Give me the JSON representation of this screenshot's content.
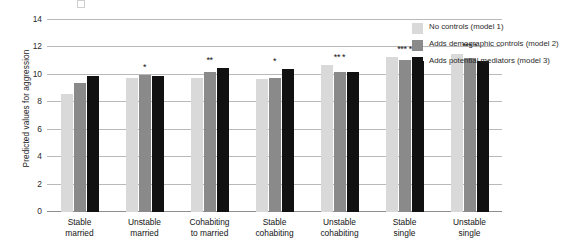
{
  "chart_data": {
    "type": "bar",
    "title": "",
    "xlabel": "",
    "ylabel": "Predicted values for aggression",
    "ylim": [
      0,
      14
    ],
    "yticks": [
      0,
      2,
      4,
      6,
      8,
      10,
      12,
      14
    ],
    "ytick_labels": [
      "0",
      "2",
      "4",
      "6",
      "8",
      "10",
      "12",
      "14"
    ],
    "grid": true,
    "legend_position": "right",
    "categories": [
      "Stable married",
      "Unstable married",
      "Cohabiting to married",
      "Stable cohabiting",
      "Unstable cohabiting",
      "Stable single",
      "Unstable single"
    ],
    "category_lines": [
      [
        "Stable",
        "married"
      ],
      [
        "Unstable",
        "married"
      ],
      [
        "Cohabiting",
        "to married"
      ],
      [
        "Stable",
        "cohabiting"
      ],
      [
        "Unstable",
        "cohabiting"
      ],
      [
        "Stable",
        "single"
      ],
      [
        "Unstable",
        "single"
      ]
    ],
    "series": [
      {
        "name": "No controls (model 1)",
        "color": "#d9d9d9",
        "values": [
          8.6,
          9.8,
          9.75,
          9.7,
          10.7,
          11.3,
          11.5
        ]
      },
      {
        "name": "Adds demographic controls (model 2)",
        "color": "#8a8a8a",
        "values": [
          9.4,
          10.0,
          10.2,
          9.8,
          10.2,
          11.1,
          11.2
        ]
      },
      {
        "name": "Adds potential mediators (model 3)",
        "color": "#111111",
        "values": [
          9.9,
          9.95,
          10.5,
          10.4,
          10.2,
          11.0,
          11.0
        ]
      }
    ],
    "significance_annotations": [
      {
        "category": "Stable married",
        "marks": ""
      },
      {
        "category": "Unstable married",
        "marks": "*"
      },
      {
        "category": "Cohabiting to married",
        "marks": "**"
      },
      {
        "category": "Stable cohabiting",
        "marks": "*"
      },
      {
        "category": "Unstable cohabiting",
        "marks": "** *"
      },
      {
        "category": "Stable single",
        "marks": "*** *"
      },
      {
        "category": "Unstable single",
        "marks": "*** *"
      }
    ]
  },
  "legend": {
    "items": [
      {
        "label": "No controls (model 1)",
        "color": "#d9d9d9"
      },
      {
        "label": "Adds demographic controls (model 2)",
        "color": "#8a8a8a"
      },
      {
        "label": "Adds potential mediators (model 3)",
        "color": "#111111"
      }
    ]
  }
}
